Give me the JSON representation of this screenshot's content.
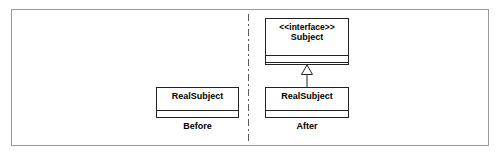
{
  "figure": {
    "background_color": "#ffffff",
    "frame_border_color": "#9a9a9a",
    "line_color": "#222222"
  },
  "divider": {
    "style": "dash-dot",
    "color": "#5a5a5a"
  },
  "panels": [
    {
      "caption": "Before",
      "classes": [
        {
          "name": "RealSubject",
          "stereotype": "",
          "attributes": [],
          "operations": []
        }
      ]
    },
    {
      "caption": "After",
      "classes": [
        {
          "name": "Subject",
          "stereotype": "<<interface>>",
          "attributes": [],
          "operations": []
        },
        {
          "name": "RealSubject",
          "stereotype": "",
          "attributes": [],
          "operations": []
        }
      ]
    }
  ],
  "relationships": [
    {
      "type": "realization",
      "from": "RealSubject",
      "to": "Subject",
      "arrowhead": "hollow-triangle",
      "line": "solid"
    }
  ]
}
